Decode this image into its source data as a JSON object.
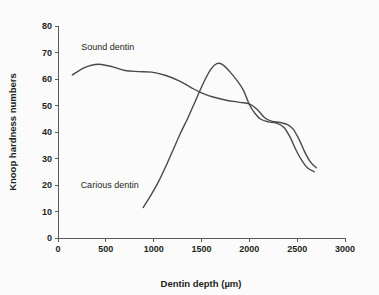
{
  "chart_data": {
    "type": "line",
    "title": "",
    "xlabel": "Dentin depth (µm)",
    "ylabel": "Knoop hardness numbers",
    "xlim": [
      0,
      3000
    ],
    "ylim": [
      0,
      80
    ],
    "xticks": [
      0,
      500,
      1000,
      1500,
      2000,
      2500,
      3000
    ],
    "xtick_labels": [
      "0",
      "500",
      "1000",
      "1500",
      "2000",
      "2500",
      "3000"
    ],
    "yticks": [
      0,
      10,
      20,
      30,
      40,
      50,
      60,
      70,
      80
    ],
    "ytick_labels": [
      "0",
      "10",
      "20",
      "30",
      "40",
      "50",
      "60",
      "70",
      "80"
    ],
    "grid": false,
    "legend": "inline-annotations",
    "line_color": "#4a4a4a",
    "series": [
      {
        "name": "Sound dentin",
        "label_x": 520,
        "label_y": 71,
        "x": [
          150,
          260,
          360,
          450,
          560,
          700,
          840,
          980,
          1120,
          1260,
          1400,
          1500,
          1620,
          1760,
          1900,
          2000,
          2080,
          2160,
          2240,
          2320,
          2400,
          2460,
          2520,
          2580,
          2640,
          2700
        ],
        "y": [
          61.5,
          64.0,
          65.3,
          65.5,
          64.7,
          63.2,
          62.8,
          62.6,
          61.4,
          59.4,
          56.6,
          54.8,
          53.2,
          52.0,
          51.2,
          50.6,
          48.6,
          45.4,
          44.0,
          43.6,
          42.8,
          41.0,
          37.2,
          32.4,
          28.6,
          26.5
        ]
      },
      {
        "name": "Carious dentin",
        "label_x": 540,
        "label_y": 19,
        "x": [
          890,
          960,
          1040,
          1120,
          1200,
          1280,
          1360,
          1440,
          1520,
          1600,
          1660,
          1720,
          1800,
          1880,
          1940,
          2000,
          2060,
          2120,
          2200,
          2280,
          2360,
          2430,
          2490,
          2550,
          2610,
          2680
        ],
        "y": [
          11.5,
          15.5,
          20.5,
          26.5,
          33.0,
          39.5,
          45.5,
          52.0,
          58.5,
          63.8,
          65.8,
          65.4,
          62.6,
          59.0,
          55.6,
          50.4,
          47.0,
          44.8,
          43.8,
          43.4,
          41.8,
          37.8,
          33.0,
          29.2,
          26.4,
          25.0
        ]
      }
    ]
  },
  "geometry": {
    "plot_left": 58,
    "plot_right": 345,
    "plot_bottom": 238,
    "plot_top": 26
  }
}
